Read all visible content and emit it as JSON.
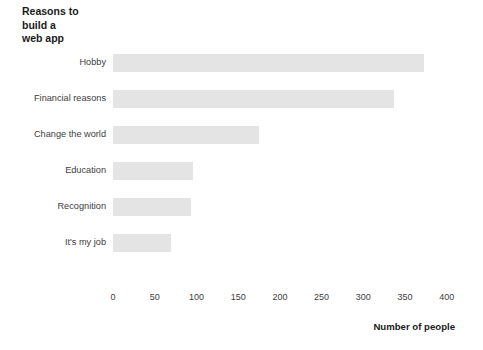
{
  "chart_data": {
    "type": "bar",
    "orientation": "horizontal",
    "title": "Reasons to\nbuild a\nweb app",
    "xlabel": "Number of people",
    "ylabel": "",
    "categories": [
      "Hobby",
      "Financial reasons",
      "Change the world",
      "Education",
      "Recognition",
      "It's my job"
    ],
    "values": [
      373,
      337,
      175,
      96,
      93,
      69
    ],
    "xticks": [
      0,
      50,
      100,
      150,
      200,
      250,
      300,
      350,
      400
    ],
    "xtick_labels": [
      "0",
      "50",
      "100",
      "150",
      "200",
      "250",
      "300",
      "350",
      "400"
    ],
    "xlim": [
      0,
      400
    ],
    "grid": false,
    "legend": null,
    "bar_color": "#e4e4e4",
    "text_color": "#3d3d3d",
    "background": "#ffffff"
  }
}
